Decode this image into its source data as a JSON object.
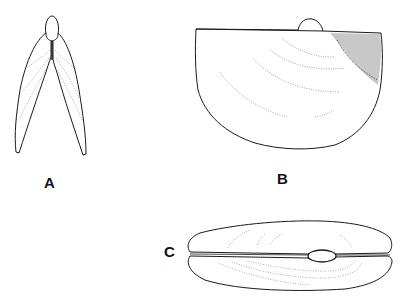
{
  "figure": {
    "panels": [
      {
        "id": "A",
        "label": "A",
        "view": "anterior view of shell, valves open"
      },
      {
        "id": "B",
        "label": "B",
        "view": "lateral view of valve"
      },
      {
        "id": "C",
        "label": "C",
        "view": "dorsal view of closed valves"
      }
    ],
    "colors": {
      "line": "#1a1a1a",
      "stipple": "#555555",
      "background": "#ffffff"
    }
  }
}
